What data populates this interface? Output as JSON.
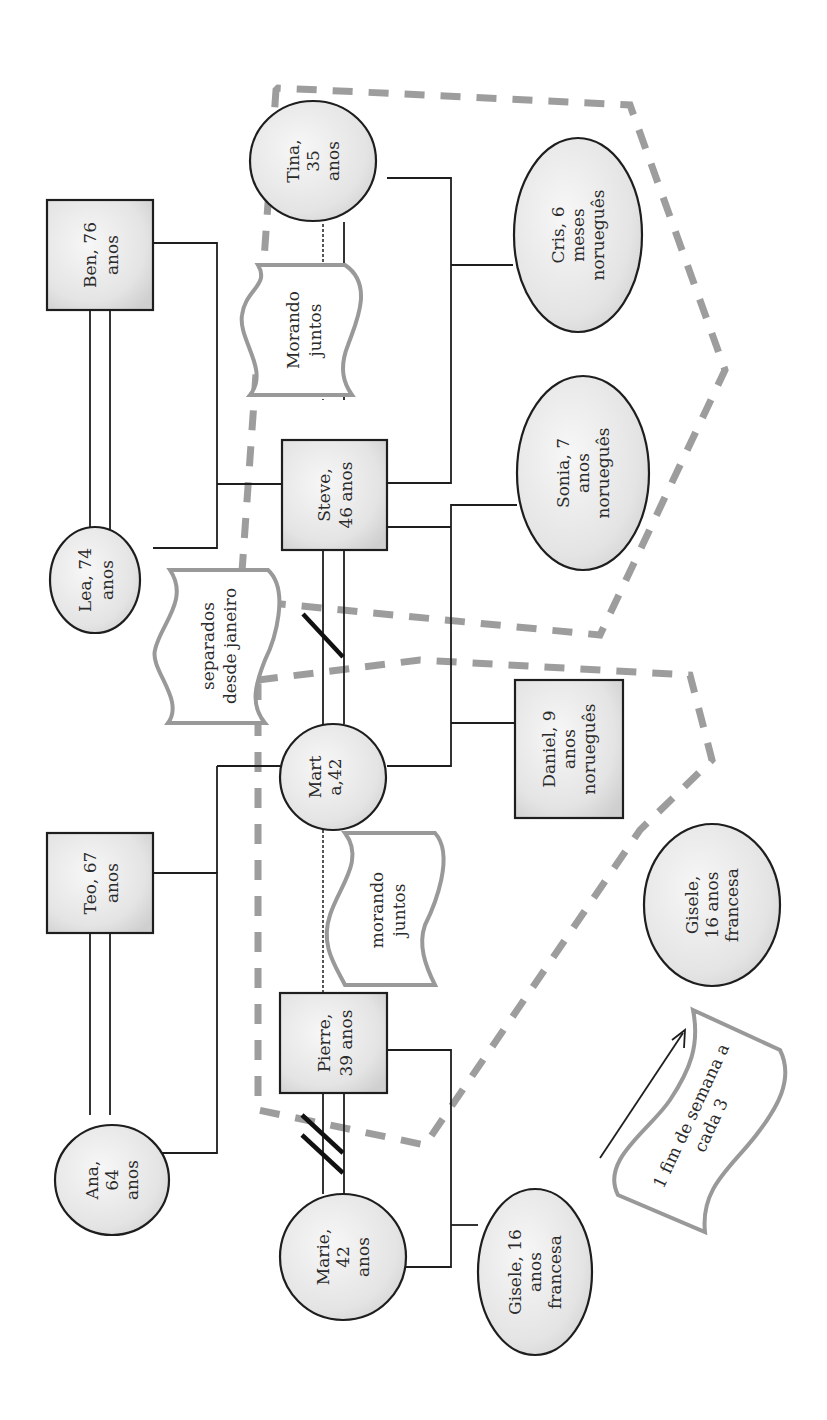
{
  "diagram": {
    "type": "genogram",
    "orientation": "rotated-90-ccw",
    "colors": {
      "node_border": "#1e1e1e",
      "node_fill": "#e6e6e6",
      "boundary_dash": "#8c8c8c",
      "note_border": "#999999"
    },
    "people": {
      "ben": {
        "line1": "Ben, 76",
        "line2": "anos",
        "line3": "",
        "shape": "square"
      },
      "lea": {
        "line1": "Lea, 74",
        "line2": "anos",
        "line3": "",
        "shape": "ellipse"
      },
      "teo": {
        "line1": "Teo, 67",
        "line2": "anos",
        "line3": "",
        "shape": "square"
      },
      "ana": {
        "line1": "Ana,",
        "line2": "64",
        "line3": "anos",
        "shape": "ellipse"
      },
      "steve": {
        "line1": "Steve,",
        "line2": "46 anos",
        "line3": "",
        "shape": "square"
      },
      "tina": {
        "line1": "Tina,",
        "line2": "35",
        "line3": "anos",
        "shape": "circle"
      },
      "marta": {
        "line1": "Mart",
        "line2": "a,42",
        "line3": "anos",
        "shape": "circle"
      },
      "pierre": {
        "line1": "Pierre,",
        "line2": "39 anos",
        "line3": "",
        "shape": "square"
      },
      "marie": {
        "line1": "Marie,",
        "line2": "42",
        "line3": "anos",
        "shape": "circle"
      },
      "cris": {
        "line1": "Cris, 6",
        "line2": "meses",
        "line3": "norueguês",
        "shape": "ellipse"
      },
      "sonia": {
        "line1": "Sonia, 7",
        "line2": "anos",
        "line3": "norueguês",
        "shape": "ellipse"
      },
      "daniel": {
        "line1": "Daniel, 9",
        "line2": "anos",
        "line3": "norueguês",
        "shape": "square"
      },
      "gisele_with_marie": {
        "line1": "Gisele, 16",
        "line2": "anos",
        "line3": "francesa",
        "shape": "ellipse"
      },
      "gisele_visiting": {
        "line1": "Gisele,",
        "line2": "16 anos",
        "line3": "francesa",
        "shape": "circle"
      }
    },
    "notes": {
      "steve_tina": {
        "line1": "Morando",
        "line2": "juntos"
      },
      "steve_marta": {
        "line1": "separados",
        "line2": "desde janeiro"
      },
      "marta_pierre": {
        "line1": "morando",
        "line2": "juntos"
      },
      "visit": {
        "line1": "1 fim de semana a",
        "line2": "cada 3"
      }
    },
    "relationships": [
      {
        "a": "Ben",
        "b": "Lea",
        "type": "married"
      },
      {
        "a": "Teo",
        "b": "Ana",
        "type": "married"
      },
      {
        "a": "Steve",
        "b": "Tina",
        "type": "cohabiting"
      },
      {
        "a": "Steve",
        "b": "Marta",
        "type": "separated"
      },
      {
        "a": "Marta",
        "b": "Pierre",
        "type": "cohabiting"
      },
      {
        "a": "Pierre",
        "b": "Marie",
        "type": "divorced"
      }
    ],
    "households": [
      "Steve + Tina + Cris + Sonia",
      "Marta + Pierre + Daniel + Gisele (visiting)"
    ]
  }
}
